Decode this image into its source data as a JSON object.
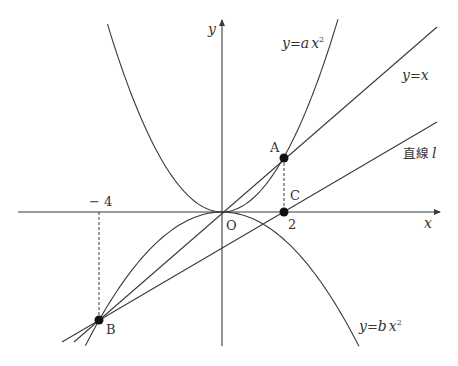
{
  "diagram": {
    "type": "coordinate-graph",
    "axes": {
      "x_label": "x",
      "y_label": "y",
      "origin_label": "O"
    },
    "ticks": {
      "neg4": "− 4",
      "pos2": "2"
    },
    "curves": [
      {
        "name": "parabola-a",
        "label_y": "y",
        "label_eq": "=",
        "label_coef": "a",
        "label_var": "x",
        "label_exp": "2",
        "coef_value": 0.5
      },
      {
        "name": "parabola-b",
        "label_y": "y",
        "label_eq": "=",
        "label_coef": "b",
        "label_var": "x",
        "label_exp": "2",
        "coef_value": -0.25
      },
      {
        "name": "line-y-eq-x",
        "label_y": "y",
        "label_eq": "=",
        "label_var": "x"
      },
      {
        "name": "line-l",
        "label_kanji": "直線",
        "label_var": "l"
      }
    ],
    "points": [
      {
        "label": "A",
        "x": 2,
        "y": 2
      },
      {
        "label": "B",
        "x": -4,
        "y": -4
      },
      {
        "label": "C",
        "x": 2,
        "y": 0
      }
    ],
    "colors": {
      "line": "#3a3a3a",
      "point": "#111111",
      "background": "#ffffff"
    }
  }
}
